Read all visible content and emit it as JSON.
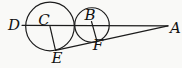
{
  "figure": {
    "labels": {
      "D": "D",
      "C": "C",
      "B": "B",
      "A": "A",
      "E": "E",
      "F": "F"
    }
  },
  "colors": {
    "stroke": "#1c1c1c",
    "label": "#111111",
    "background": "#f9f9f7"
  }
}
